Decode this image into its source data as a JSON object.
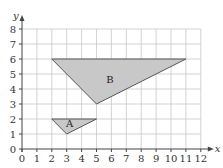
{
  "chart_data": {
    "type": "diagram",
    "title": "",
    "xlabel": "x",
    "ylabel": "y",
    "xlim": [
      0,
      12
    ],
    "ylim": [
      0,
      8
    ],
    "grid": true,
    "x_ticks": [
      "0",
      "1",
      "2",
      "3",
      "4",
      "5",
      "6",
      "7",
      "8",
      "9",
      "10",
      "11",
      "12"
    ],
    "y_ticks": [
      "0",
      "1",
      "2",
      "3",
      "4",
      "5",
      "6",
      "7",
      "8"
    ],
    "shapes": [
      {
        "label": "A",
        "type": "triangle",
        "vertices": [
          [
            2,
            2
          ],
          [
            5,
            2
          ],
          [
            3,
            1
          ]
        ],
        "fill": "#c8c8c8",
        "label_pos": [
          3.2,
          1.65
        ]
      },
      {
        "label": "B",
        "type": "triangle",
        "vertices": [
          [
            2,
            6
          ],
          [
            11,
            6
          ],
          [
            5,
            3
          ]
        ],
        "fill": "#c8c8c8",
        "label_pos": [
          5.9,
          4.6
        ]
      }
    ]
  },
  "colors": {
    "grid": "#c8c8c8",
    "axis": "#444444",
    "shape_fill": "#c8c8c8",
    "shape_stroke": "#555555"
  }
}
